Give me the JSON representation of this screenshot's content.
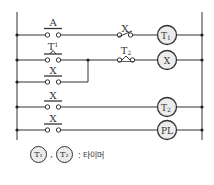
{
  "diagram": {
    "type": "ladder",
    "rails": {
      "left_x": 17,
      "right_x": 202,
      "top_y": 12,
      "bottom_y": 140
    },
    "rungs": [
      {
        "id": "rung-1",
        "y": 35,
        "contacts": [
          {
            "label": "A",
            "kind": "NO"
          },
          {
            "label": "X",
            "kind": "NC"
          }
        ],
        "coil": {
          "label": "T",
          "sub": "1"
        }
      },
      {
        "id": "rung-2",
        "y": 60,
        "contacts": [
          {
            "label": "T",
            "sub": "1",
            "kind": "timer-NO"
          },
          {
            "label": "T",
            "sub": "2",
            "kind": "timer-NC"
          }
        ],
        "coil": {
          "label": "X",
          "sub": ""
        }
      },
      {
        "id": "rung-3",
        "y": 82,
        "contacts": [
          {
            "label": "X",
            "kind": "NO"
          }
        ],
        "coil": null,
        "branch_to": "rung-2"
      },
      {
        "id": "rung-4",
        "y": 107,
        "contacts": [
          {
            "label": "X",
            "kind": "NO"
          }
        ],
        "coil": {
          "label": "T",
          "sub": "2"
        }
      },
      {
        "id": "rung-5",
        "y": 130,
        "contacts": [
          {
            "label": "X",
            "kind": "NO"
          }
        ],
        "coil": {
          "label": "PL",
          "sub": ""
        }
      }
    ]
  },
  "labels": {
    "r1_c1": "A",
    "r1_c2": "X",
    "r1_coil": "T",
    "r1_coil_sub": "1",
    "r2_c1": "T",
    "r2_c1_sub": "1",
    "r2_c2": "T",
    "r2_c2_sub": "2",
    "r2_coil": "X",
    "r3_c1": "X",
    "r4_c1": "X",
    "r4_coil": "T",
    "r4_coil_sub": "2",
    "r5_c1": "X",
    "r5_coil": "PL"
  },
  "legend": {
    "coil1": "T₁",
    "separator": ",",
    "coil2": "T₂",
    "text": ": 타이머"
  }
}
